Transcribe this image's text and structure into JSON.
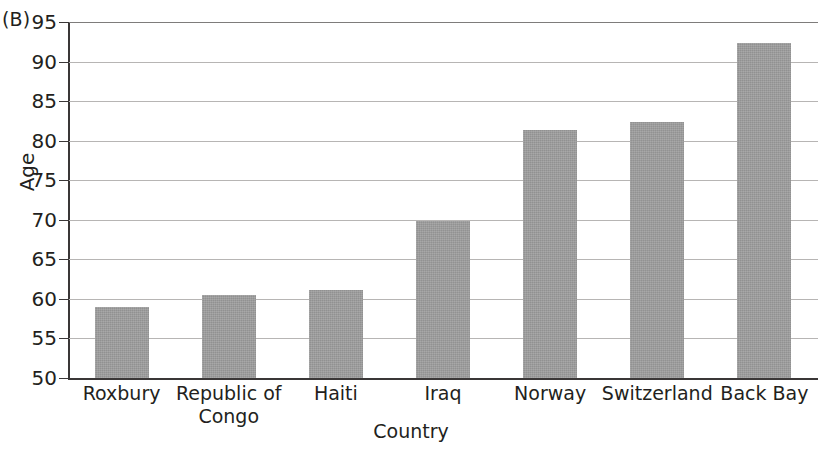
{
  "panel_label": "(B)",
  "chart_data": {
    "type": "bar",
    "title": "",
    "xlabel": "Country",
    "ylabel": "Age",
    "categories": [
      "Roxbury",
      "Republic of Congo",
      "Haiti",
      "Iraq",
      "Norway",
      "Switzerland",
      "Back Bay"
    ],
    "category_lines": [
      [
        "Roxbury"
      ],
      [
        "Republic of",
        "Congo"
      ],
      [
        "Haiti"
      ],
      [
        "Iraq"
      ],
      [
        "Norway"
      ],
      [
        "Switzerland"
      ],
      [
        "Back Bay"
      ]
    ],
    "values": [
      59.0,
      60.5,
      61.1,
      69.8,
      81.3,
      82.3,
      92.3
    ],
    "ylim": [
      50,
      95
    ],
    "yticks": [
      50,
      55,
      60,
      65,
      70,
      75,
      80,
      85,
      90,
      95
    ],
    "ytick_labels": [
      "50",
      "55",
      "60",
      "65",
      "70",
      "75",
      "80",
      "85",
      "90",
      "95"
    ],
    "grid": true,
    "legend": false,
    "bar_color": "#9e9e9e",
    "axis_color": "#3a3737",
    "grid_color": "#b7b5b4"
  }
}
